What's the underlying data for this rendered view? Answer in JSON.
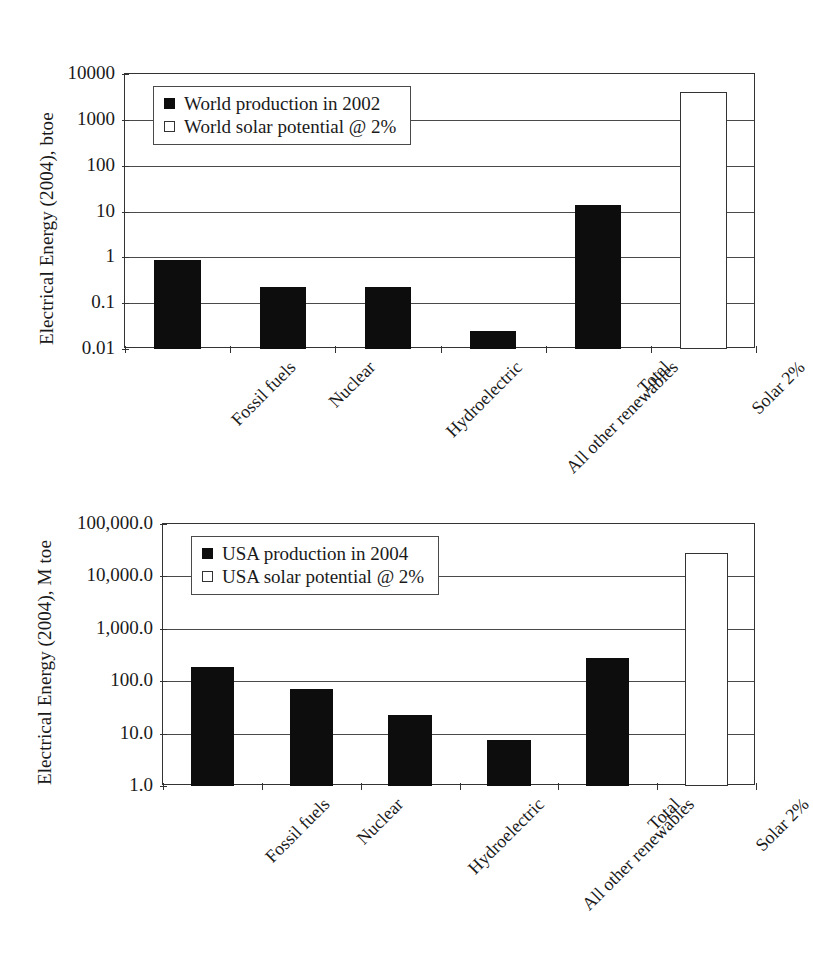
{
  "chart_data": [
    {
      "id": "world",
      "type": "bar",
      "title": "",
      "xlabel": "",
      "ylabel": "Electrical Energy (2004), btoe",
      "yscale": "log",
      "ylim": [
        0.01,
        10000
      ],
      "ytick_labels": [
        "10000",
        "1000",
        "100",
        "10",
        "1",
        "0.1",
        "0.01"
      ],
      "ytick_values": [
        10000,
        1000,
        100,
        10,
        1,
        0.1,
        0.01
      ],
      "grid": true,
      "legend_position": "upper-left-inside",
      "categories": [
        "Fossil fuels",
        "Nuclear",
        "Hydroelectric",
        "All other renewables",
        "Total",
        "Solar 2%"
      ],
      "series": [
        {
          "name": "World production in 2002",
          "style": "filled",
          "values": [
            0.88,
            0.22,
            0.22,
            0.025,
            14,
            null
          ]
        },
        {
          "name": "World solar potential @ 2%",
          "style": "hollow",
          "values": [
            null,
            null,
            null,
            null,
            null,
            4000
          ]
        }
      ]
    },
    {
      "id": "usa",
      "type": "bar",
      "title": "",
      "xlabel": "",
      "ylabel": "Electrical Energy (2004), M toe",
      "yscale": "log",
      "ylim": [
        1.0,
        100000.0
      ],
      "ytick_labels": [
        "100,000.0",
        "10,000.0",
        "1,000.0",
        "100.0",
        "10.0",
        "1.0"
      ],
      "ytick_values": [
        100000,
        10000,
        1000,
        100,
        10,
        1
      ],
      "grid": true,
      "legend_position": "upper-left-inside",
      "categories": [
        "Fossil fuels",
        "Nuclear",
        "Hydroelectric",
        "All other renewables",
        "Total",
        "Solar 2%"
      ],
      "series": [
        {
          "name": "USA production in 2004",
          "style": "filled",
          "values": [
            190,
            70,
            23,
            7.5,
            280,
            null
          ]
        },
        {
          "name": "USA solar potential @ 2%",
          "style": "hollow",
          "values": [
            null,
            null,
            null,
            null,
            null,
            28000
          ]
        }
      ]
    }
  ]
}
